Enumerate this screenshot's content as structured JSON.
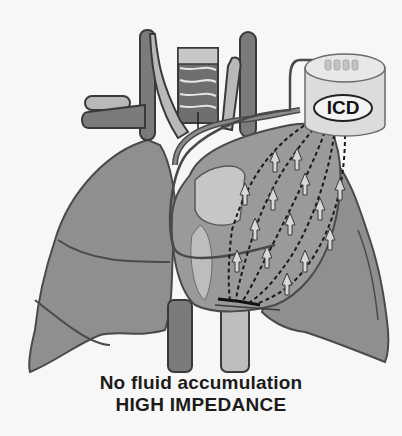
{
  "diagram": {
    "device_label": "ICD",
    "caption_line1": "No fluid accumulation",
    "caption_line2": "HIGH IMPEDANCE",
    "colors": {
      "background": "#f7f7f7",
      "lung_fill": "#8f8f8f",
      "outline": "#4a4a4a",
      "vessel_fill": "#7b7b7b",
      "vessel_light": "#b9b9b9",
      "heart_fill": "#9a9a9a",
      "device_fill": "#dcdcdc",
      "text": "#1c1c1c"
    },
    "elements": [
      "left-lung",
      "right-lung",
      "trachea",
      "aorta",
      "superior-vena-cava",
      "heart",
      "icd-device",
      "lead-wire",
      "current-vector-dashes",
      "impedance-arrows"
    ]
  }
}
